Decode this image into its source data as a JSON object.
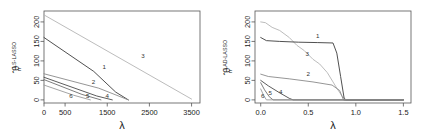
{
  "figure": {
    "background": "#ffffff",
    "axis_color": "#555555",
    "text_color": "#1a1a1a"
  },
  "panels": [
    {
      "id": "left",
      "ylabel": {
        "theta": "θ",
        "hat": "̂",
        "subscript": "n",
        "superscript": "LS-LASSO"
      },
      "xlabel": "λ",
      "chart_data": {
        "type": "line",
        "title": "",
        "xlabel": "λ",
        "ylabel": "theta_hat_n^{LS-LASSO}",
        "xlim": [
          0,
          3700
        ],
        "ylim": [
          -8,
          228
        ],
        "xticks": [
          0,
          500,
          1500,
          2500,
          3500
        ],
        "xticklabels": [
          "0",
          "500",
          "1500",
          "2500",
          "3500"
        ],
        "yticks": [
          0,
          50,
          100,
          150,
          200
        ],
        "yticklabels": [
          "0",
          "50",
          "100",
          "150",
          "200"
        ],
        "grid": false,
        "legend": "inline-labels",
        "series": [
          {
            "name": "3",
            "label": "3",
            "color": "#b4b4b4",
            "label_xy": [
              2350,
              108
            ],
            "x": [
              0,
              3500
            ],
            "y": [
              218,
              2
            ]
          },
          {
            "name": "1",
            "label": "1",
            "color": "#3c3c3c",
            "label_xy": [
              1430,
              78
            ],
            "x": [
              0,
              1180,
              1700,
              2000
            ],
            "y": [
              160,
              73,
              20,
              0
            ]
          },
          {
            "name": "2",
            "label": "2",
            "color": "#8a8a8a",
            "label_xy": [
              1175,
              42
            ],
            "x": [
              0,
              1300,
              2000
            ],
            "y": [
              67,
              30,
              0
            ]
          },
          {
            "name": "4",
            "label": "4",
            "color": "#4a4a4a",
            "label_xy": [
              1500,
              6
            ],
            "x": [
              0,
              1250,
              1620
            ],
            "y": [
              58,
              10,
              0
            ]
          },
          {
            "name": "5",
            "label": "5",
            "color": "#6e6e6e",
            "label_xy": [
              1040,
              6
            ],
            "x": [
              0,
              900,
              1350
            ],
            "y": [
              52,
              14,
              0
            ]
          },
          {
            "name": "6",
            "label": "6",
            "color": "#9a9a9a",
            "label_xy": [
              640,
              6
            ],
            "x": [
              0,
              700,
              1100
            ],
            "y": [
              38,
              12,
              0
            ]
          }
        ]
      }
    },
    {
      "id": "right",
      "ylabel": {
        "theta": "θ",
        "hat": "̂",
        "subscript": "n",
        "superscript": "LAD-LASSO"
      },
      "xlabel": "λ",
      "chart_data": {
        "type": "line",
        "title": "",
        "xlabel": "λ",
        "ylabel": "theta_hat_n^{LAD-LASSO}",
        "xlim": [
          -0.06,
          1.58
        ],
        "ylim": [
          -8,
          228
        ],
        "xticks": [
          0.0,
          0.5,
          1.0,
          1.5
        ],
        "xticklabels": [
          "0.0",
          "0.5",
          "1.0",
          "1.5"
        ],
        "yticks": [
          0,
          50,
          100,
          150,
          200
        ],
        "yticklabels": [
          "0",
          "50",
          "100",
          "150",
          "200"
        ],
        "grid": false,
        "legend": "inline-labels",
        "series": [
          {
            "name": "3",
            "label": "3",
            "color": "#b4b4b4",
            "label_xy": [
              0.49,
              112
            ],
            "x": [
              0.0,
              0.05,
              0.12,
              0.2,
              0.3,
              0.38,
              0.46,
              0.55,
              0.62,
              0.7,
              0.76,
              0.8,
              0.86,
              0.9,
              1.5
            ],
            "y": [
              200,
              198,
              186,
              178,
              160,
              140,
              126,
              104,
              92,
              70,
              46,
              30,
              8,
              0,
              0
            ]
          },
          {
            "name": "1",
            "label": "1",
            "color": "#3c3c3c",
            "label_xy": [
              0.6,
              158
            ],
            "x": [
              0.0,
              0.06,
              0.2,
              0.4,
              0.6,
              0.76,
              0.8,
              0.84,
              0.88,
              1.5
            ],
            "y": [
              160,
              152,
              150,
              148,
              147,
              146,
              120,
              60,
              0,
              0
            ]
          },
          {
            "name": "2",
            "label": "2",
            "color": "#8a8a8a",
            "label_xy": [
              0.5,
              62
            ],
            "x": [
              0.0,
              0.08,
              0.3,
              0.55,
              0.75,
              0.83,
              0.87,
              1.5
            ],
            "y": [
              66,
              60,
              54,
              46,
              38,
              24,
              0,
              0
            ]
          },
          {
            "name": "4",
            "label": "4",
            "color": "#4a4a4a",
            "label_xy": [
              0.21,
              16
            ],
            "x": [
              0.0,
              0.08,
              0.2,
              0.3,
              0.34,
              1.5
            ],
            "y": [
              50,
              36,
              18,
              4,
              0,
              0
            ]
          },
          {
            "name": "5",
            "label": "5",
            "color": "#6e6e6e",
            "label_xy": [
              0.1,
              12
            ],
            "x": [
              0.0,
              0.04,
              0.09,
              0.13,
              1.5
            ],
            "y": [
              44,
              26,
              8,
              0,
              0
            ]
          },
          {
            "name": "6",
            "label": "6",
            "color": "#9a9a9a",
            "label_xy": [
              0.02,
              6
            ],
            "x": [
              0.0,
              0.03,
              0.06,
              1.5
            ],
            "y": [
              28,
              12,
              0,
              0
            ]
          }
        ]
      }
    }
  ]
}
